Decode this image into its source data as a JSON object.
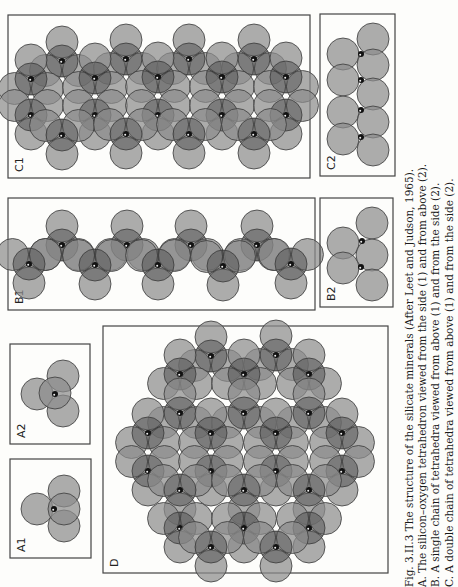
{
  "figure": {
    "panels": {
      "A1": {
        "label": "A1",
        "box": [
          10,
          459,
          81,
          99
        ],
        "oxygens": [
          [
            64,
            491
          ],
          [
            37,
            509
          ],
          [
            64,
            526
          ],
          [
            64,
            509
          ]
        ],
        "silicons": [
          [
            54,
            509
          ]
        ]
      },
      "A2": {
        "label": "A2",
        "box": [
          10,
          344,
          80,
          100
        ],
        "oxygens": [
          [
            63,
            376
          ],
          [
            37,
            394
          ],
          [
            63,
            411
          ],
          [
            55,
            393
          ]
        ],
        "silicons": [
          [
            55,
            394
          ]
        ]
      },
      "B1": {
        "label": "B1",
        "box": [
          8,
          198,
          307,
          112
        ],
        "silicons": [
          [
            62,
            245
          ],
          [
            127,
            245
          ],
          [
            191,
            245
          ],
          [
            257,
            245
          ],
          [
            29,
            264
          ],
          [
            95,
            265
          ],
          [
            158,
            265
          ],
          [
            223,
            266
          ],
          [
            291,
            264
          ]
        ]
      },
      "B2": {
        "label": "B2",
        "box": [
          320,
          198,
          73,
          109
        ],
        "oxygens": [
          [
            343,
            243
          ],
          [
            343,
            268
          ],
          [
            372,
            223
          ],
          [
            372,
            255
          ],
          [
            372,
            285
          ]
        ],
        "silicons": [
          [
            362,
            241
          ],
          [
            361,
            267
          ]
        ]
      },
      "C1": {
        "label": "C1",
        "box": [
          8,
          15,
          302,
          163
        ],
        "silicons": [
          [
            62,
            61
          ],
          [
            126,
            59
          ],
          [
            189,
            59
          ],
          [
            254,
            59
          ],
          [
            31,
            79
          ],
          [
            95,
            78
          ],
          [
            158,
            77
          ],
          [
            222,
            77
          ],
          [
            286,
            77
          ],
          [
            31,
            115
          ],
          [
            95,
            115
          ],
          [
            158,
            115
          ],
          [
            222,
            115
          ],
          [
            286,
            115
          ],
          [
            62,
            135
          ],
          [
            126,
            134
          ],
          [
            189,
            134
          ],
          [
            254,
            134
          ]
        ]
      },
      "C2": {
        "label": "C2",
        "box": [
          320,
          14,
          75,
          162
        ],
        "oxygens": [
          [
            343,
            54
          ],
          [
            343,
            80
          ],
          [
            343,
            112
          ],
          [
            343,
            139
          ],
          [
            373,
            39
          ],
          [
            373,
            65
          ],
          [
            373,
            94
          ],
          [
            373,
            122
          ],
          [
            373,
            150
          ]
        ],
        "silicons": [
          [
            361,
            54
          ],
          [
            361,
            80
          ],
          [
            361,
            110
          ],
          [
            361,
            137
          ]
        ]
      },
      "D": {
        "label": "D",
        "box": [
          103,
          326,
          285,
          247
        ],
        "silicons": [
          [
            211,
            356
          ],
          [
            276,
            355
          ],
          [
            180,
            374
          ],
          [
            244,
            374
          ],
          [
            309,
            374
          ],
          [
            180,
            413
          ],
          [
            244,
            413
          ],
          [
            309,
            413
          ],
          [
            148,
            433
          ],
          [
            211,
            433
          ],
          [
            276,
            433
          ],
          [
            342,
            433
          ],
          [
            148,
            471
          ],
          [
            211,
            471
          ],
          [
            276,
            471
          ],
          [
            342,
            471
          ],
          [
            180,
            490
          ],
          [
            244,
            490
          ],
          [
            309,
            490
          ],
          [
            180,
            528
          ],
          [
            244,
            528
          ],
          [
            309,
            528
          ],
          [
            211,
            547
          ],
          [
            276,
            547
          ]
        ]
      }
    },
    "colors": {
      "oxygen": "#8c8c8c",
      "oxygen_stroke": "#3a3a3a",
      "silicon": "#111111",
      "box": "#444444"
    }
  },
  "caption": {
    "line0": "Fig. 3.II.3  The structure of the silicate minerals (After Leet and Judson, 1965).",
    "line1": "A. The silicon–oxygen tetrahedron viewed from the side (1) and from above (2).",
    "line2": "B. A single chain of tetrahedra viewed from above (1) and from the side (2).",
    "line3": "C. A double chain of tetrahedra viewed from above (1) and from the side (2)."
  }
}
